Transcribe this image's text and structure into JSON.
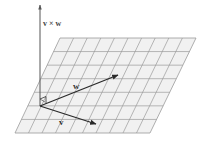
{
  "diagram": {
    "type": "vector-cross-product-illustration",
    "labels": {
      "cross_product": "v × w",
      "vector_w": "w",
      "vector_v": "v"
    },
    "colors": {
      "background": "#ffffff",
      "grid_fill": "#f1f1f1",
      "grid_line": "#9a9a9a",
      "arrow": "#2a2a2a",
      "axis": "#555555"
    },
    "plane": {
      "top_left": [
        60,
        38
      ],
      "top_right": [
        196,
        38
      ],
      "bottom_right": [
        150,
        133
      ],
      "bottom_left": [
        15,
        133
      ],
      "rows": 7,
      "cols": 10
    },
    "origin": [
      40,
      106
    ],
    "vectors": [
      {
        "name": "v×w",
        "from": [
          40,
          106
        ],
        "to": [
          40,
          4
        ]
      },
      {
        "name": "w",
        "from": [
          40,
          106
        ],
        "to": [
          118,
          75
        ]
      },
      {
        "name": "v",
        "from": [
          40,
          106
        ],
        "to": [
          96,
          124
        ]
      }
    ]
  }
}
